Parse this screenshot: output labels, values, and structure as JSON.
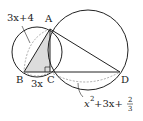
{
  "figure": {
    "type": "geometry",
    "points": {
      "A": {
        "label": "A",
        "x": 50,
        "y": 29
      },
      "B": {
        "label": "B",
        "x": 24,
        "y": 72
      },
      "C": {
        "label": "C",
        "x": 50,
        "y": 72
      },
      "D": {
        "label": "D",
        "x": 120,
        "y": 72
      }
    },
    "circles": [
      {
        "name": "small-circle",
        "cx": 37,
        "cy": 52,
        "r": 25
      },
      {
        "name": "large-circle",
        "cx": 88,
        "cy": 50,
        "r": 40
      }
    ],
    "labels": {
      "arc_AB": "3x+4",
      "segment_BC": "3x",
      "arc_CD_prefix": "x",
      "arc_CD_exp": "2",
      "arc_CD_mid": "+3x+",
      "arc_CD_frac_num": "2",
      "arc_CD_frac_den": "3",
      "point_A": "A",
      "point_B": "B",
      "point_C": "C",
      "point_D": "D"
    },
    "colors": {
      "stroke": "#222222",
      "dashed": "#888888",
      "shade": "#dcdcdc"
    }
  }
}
